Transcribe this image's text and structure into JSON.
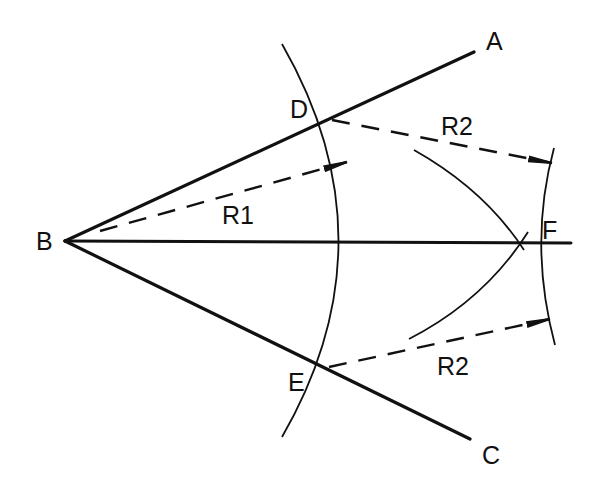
{
  "diagram": {
    "colors": {
      "ink": "#111111",
      "background": "#ffffff"
    },
    "points": {
      "A": {
        "label": "A",
        "x": 474,
        "y": 52
      },
      "B": {
        "label": "B",
        "x": 65,
        "y": 241
      },
      "C": {
        "label": "C",
        "x": 470,
        "y": 439
      },
      "D": {
        "label": "D",
        "x": 330,
        "y": 119
      },
      "E": {
        "label": "E",
        "x": 327,
        "y": 368
      },
      "F": {
        "label": "F",
        "x": 521,
        "y": 243
      }
    },
    "radii": {
      "r1": {
        "label": "R1"
      },
      "r2_upper": {
        "label": "R2"
      },
      "r2_lower": {
        "label": "R2"
      }
    },
    "lines": [
      {
        "name": "ray-BA",
        "from": "B",
        "to": "A",
        "style": "solid"
      },
      {
        "name": "ray-BC",
        "from": "B",
        "to": "C",
        "style": "solid"
      },
      {
        "name": "bisector-BF",
        "from": "B",
        "to": "F",
        "style": "solid"
      }
    ]
  }
}
